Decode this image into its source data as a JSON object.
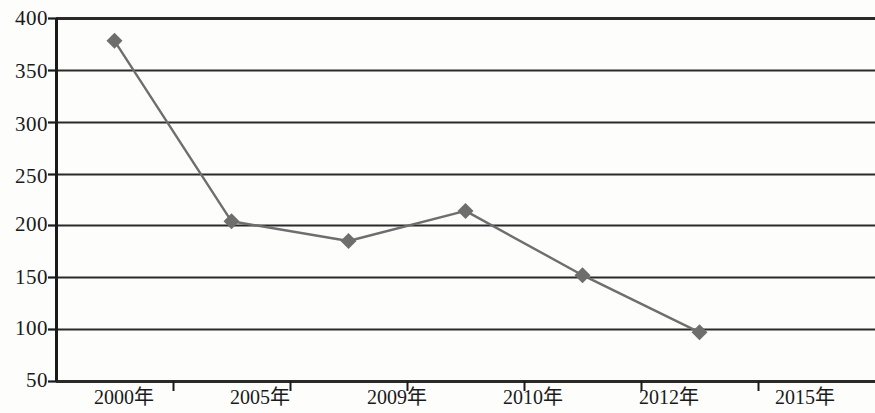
{
  "chart_data": {
    "type": "line",
    "title": "",
    "xlabel": "",
    "ylabel": "",
    "categories": [
      "2000年",
      "2005年",
      "2009年",
      "2010年",
      "2012年",
      "2015年"
    ],
    "values": [
      378,
      204,
      185,
      214,
      152,
      97
    ],
    "series": [
      {
        "name": "",
        "values": [
          378,
          204,
          185,
          214,
          152,
          97
        ]
      }
    ],
    "ylim": [
      50,
      400
    ],
    "yticks": [
      400,
      350,
      300,
      250,
      200,
      150,
      100,
      50
    ],
    "ytick_labels": [
      "400",
      "350",
      "300",
      "250",
      "200",
      "150",
      "100",
      "50"
    ],
    "grid": "horizontal",
    "legend": "none",
    "marker": "diamond",
    "line_color": "#6e6e6e",
    "marker_color": "#6e6e6e",
    "axis_color": "#1a1a1a",
    "grid_color": "#2a2a2a",
    "background": "#fdfdfc"
  },
  "yaxis": {
    "ticks": [
      {
        "label": "400",
        "value": 400
      },
      {
        "label": "350",
        "value": 350
      },
      {
        "label": "300",
        "value": 300
      },
      {
        "label": "250",
        "value": 250
      },
      {
        "label": "200",
        "value": 200
      },
      {
        "label": "150",
        "value": 150
      },
      {
        "label": "100",
        "value": 100
      },
      {
        "label": "50",
        "value": 50
      }
    ]
  },
  "xaxis": {
    "ticks": [
      {
        "label": "2000年"
      },
      {
        "label": "2005年"
      },
      {
        "label": "2009年"
      },
      {
        "label": "2010年"
      },
      {
        "label": "2012年"
      },
      {
        "label": "2015年"
      }
    ]
  }
}
